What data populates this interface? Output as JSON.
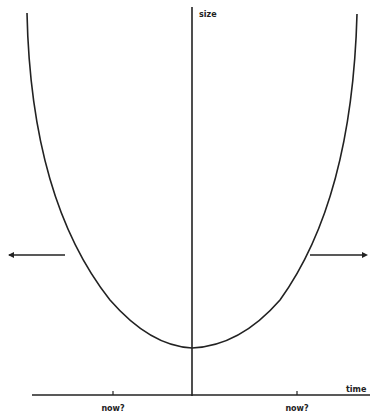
{
  "diagram": {
    "axes": {
      "y_label": "size",
      "x_label": "time"
    },
    "ticks": [
      {
        "label": "now?",
        "x": 113
      },
      {
        "label": "now?",
        "x": 297
      }
    ],
    "arrows": [
      {
        "direction": "left"
      },
      {
        "direction": "right"
      }
    ],
    "curve": {
      "type": "parabola",
      "description": "U-shaped curve with minimum near the vertical axis"
    },
    "colors": {
      "line": "#222222",
      "background": "#ffffff"
    }
  }
}
